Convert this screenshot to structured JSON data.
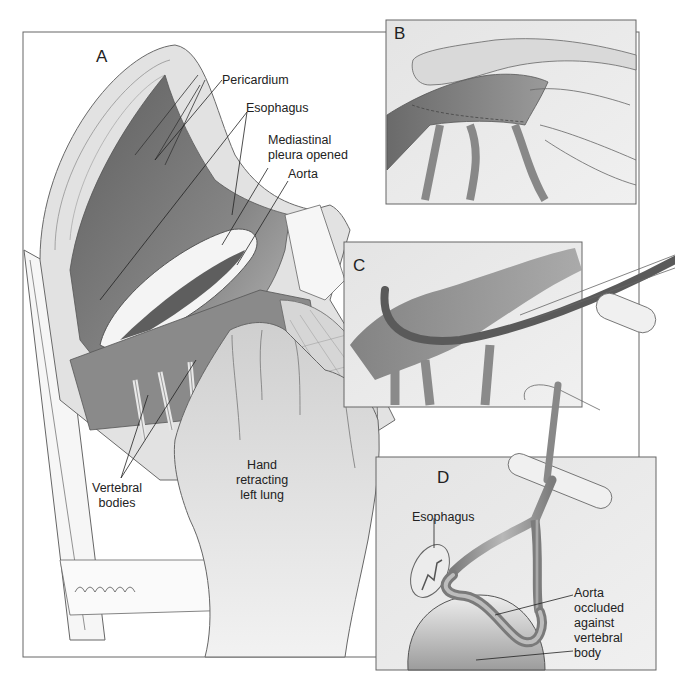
{
  "figure": {
    "panels": [
      {
        "id": "A",
        "letter": "A",
        "labels": {
          "pericardium": "Pericardium",
          "esophagus": "Esophagus",
          "mediastinal_pleura": "Mediastinal\npleura opened",
          "aorta": "Aorta",
          "vertebral_bodies": "Vertebral\nbodies",
          "hand": "Hand\nretracting\nleft lung"
        }
      },
      {
        "id": "B",
        "letter": "B",
        "labels": {}
      },
      {
        "id": "C",
        "letter": "C",
        "labels": {}
      },
      {
        "id": "D",
        "letter": "D",
        "labels": {
          "esophagus": "Esophagus",
          "aorta_occluded": "Aorta\noccluded\nagainst\nvertebral\nbody"
        }
      }
    ],
    "colors": {
      "background": "#ffffff",
      "panel_fill": "#ebebeb",
      "dark_tissue": "#6e6e6e",
      "mid_tissue": "#a8a8a8",
      "light_tissue": "#dcdcdc",
      "outline": "#555555",
      "text": "#222222"
    }
  }
}
